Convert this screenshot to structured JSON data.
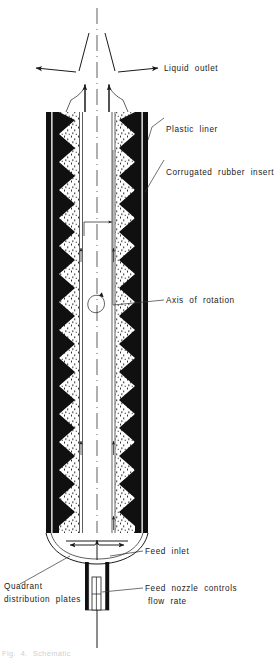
{
  "figure": {
    "type": "technical-cross-section-diagram",
    "background_color": "#ffffff",
    "ink_color": "#101010"
  },
  "labels": {
    "liquid_outlet": "Liquid  outlet",
    "plastic_liner": "Plastic  liner",
    "corrugated_rubber_insert": "Corrugated  rubber  insert",
    "axis_of_rotation": "Axis  of  rotation",
    "feed_inlet": "Feed  inlet",
    "feed_nozzle_line1": "Feed  nozzle  controls",
    "feed_nozzle_line2": "flow  rate",
    "quadrant_line1": "Quadrant",
    "quadrant_line2": "distribution  plates",
    "caption_cut": "Fig.  4.  Schematic"
  },
  "icons": {
    "rotation": "rotation-loop-icon",
    "outlet_left": "outlet-arrow-left-icon",
    "outlet_right": "outlet-arrow-right-icon",
    "flow_up_left": "flow-arrow-up-left-icon",
    "flow_up_right": "flow-arrow-up-right-icon",
    "radial_flow": "radial-flow-arrow-icon",
    "spread_left": "spread-arrow-left-icon",
    "spread_right": "spread-arrow-right-icon",
    "feed_up": "feed-arrow-up-icon"
  },
  "geometry": {
    "body": {
      "top_y": 112,
      "bottom_y": 533,
      "left_outer_x": 46,
      "right_outer_x": 148,
      "axis_x": 97
    },
    "corrugation": {
      "teeth_count": 15,
      "pitch_px": 28,
      "amplitude_px": 16
    },
    "nozzle": {
      "top_y": 560,
      "bottom_y": 610,
      "width_px": 22
    }
  },
  "colors": {
    "ink": "#101010",
    "leader": "#333333",
    "caption_faint": "#cfcfcf",
    "paper": "#ffffff"
  }
}
